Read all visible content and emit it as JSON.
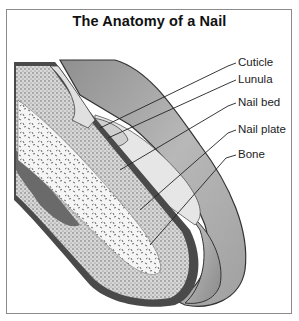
{
  "title": "The Anatomy of a Nail",
  "labels": [
    {
      "id": "cuticle",
      "text": "Cuticle"
    },
    {
      "id": "lunula",
      "text": "Lunula"
    },
    {
      "id": "nail-bed",
      "text": "Nail bed"
    },
    {
      "id": "nail-plate",
      "text": "Nail plate"
    },
    {
      "id": "bone",
      "text": "Bone"
    }
  ],
  "colors": {
    "frame": "#8a8a8a",
    "nail_plate": "#a9a9a9",
    "nail_plate_light": "#dcdcdc",
    "skin_dark": "#4a4a4a",
    "tissue_stipple": "#9a9a9a",
    "bone": "#f2f2f2"
  }
}
